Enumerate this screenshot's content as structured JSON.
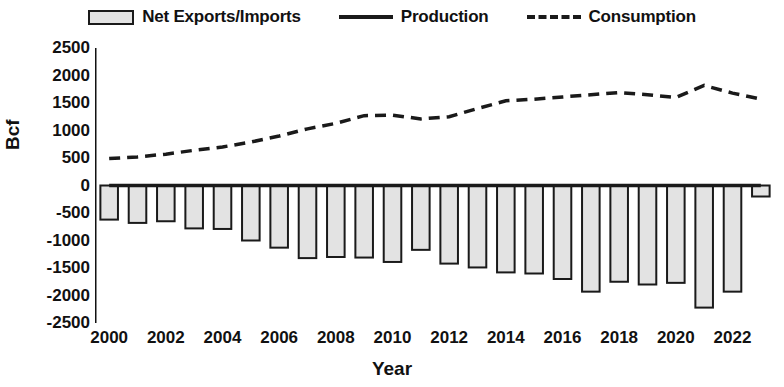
{
  "legend": {
    "items": [
      {
        "label": "Net Exports/Imports",
        "marker": "bar-swatch-icon"
      },
      {
        "label": "Production",
        "marker": "solid-line-icon"
      },
      {
        "label": "Consumption",
        "marker": "dashed-line-icon"
      }
    ]
  },
  "axes": {
    "y_title": "Bcf",
    "x_title": "Year"
  },
  "colors": {
    "bar_fill": "#e3e3e3",
    "bar_stroke": "#1a1a1a",
    "line": "#1a1a1a",
    "text": "#111111",
    "background": "#ffffff"
  },
  "chart_data": {
    "type": "bar",
    "title": "",
    "subtitle": "",
    "xlabel": "Year",
    "ylabel": "Bcf",
    "ylim": [
      -2500,
      2500
    ],
    "ytick_labels": [
      "2500",
      "2000",
      "1500",
      "1000",
      "500",
      "0",
      "-500",
      "-1000",
      "-1500",
      "-2000",
      "-2500"
    ],
    "ytick_values": [
      2500,
      2000,
      1500,
      1000,
      500,
      0,
      -500,
      -1000,
      -1500,
      -2000,
      -2500
    ],
    "xtick_labels": [
      "2000",
      "2002",
      "2004",
      "2006",
      "2008",
      "2010",
      "2012",
      "2014",
      "2016",
      "2018",
      "2020",
      "2022"
    ],
    "xtick_values": [
      2000,
      2002,
      2004,
      2006,
      2008,
      2010,
      2012,
      2014,
      2016,
      2018,
      2020,
      2022
    ],
    "grid": false,
    "legend_position": "top",
    "categories": [
      2000,
      2001,
      2002,
      2003,
      2004,
      2005,
      2006,
      2007,
      2008,
      2009,
      2010,
      2011,
      2012,
      2013,
      2014,
      2015,
      2016,
      2017,
      2018,
      2019,
      2020,
      2021,
      2022,
      2023
    ],
    "series": [
      {
        "name": "Net Exports/Imports",
        "type": "bar",
        "values": [
          -620,
          -680,
          -650,
          -780,
          -790,
          -1000,
          -1130,
          -1320,
          -1300,
          -1310,
          -1390,
          -1170,
          -1420,
          -1490,
          -1580,
          -1600,
          -1700,
          -1930,
          -1750,
          -1800,
          -1770,
          -2220,
          -1930,
          -200
        ]
      },
      {
        "name": "Production",
        "type": "line",
        "style": "solid",
        "values": [
          0,
          0,
          0,
          0,
          0,
          0,
          0,
          0,
          0,
          0,
          0,
          0,
          0,
          0,
          0,
          0,
          0,
          0,
          0,
          0,
          0,
          0,
          0,
          0
        ]
      },
      {
        "name": "Consumption",
        "type": "line",
        "style": "dashed",
        "values": [
          490,
          520,
          570,
          640,
          700,
          790,
          900,
          1030,
          1130,
          1270,
          1280,
          1210,
          1250,
          1400,
          1540,
          1570,
          1610,
          1650,
          1690,
          1650,
          1600,
          1820,
          1680,
          1570
        ]
      }
    ]
  }
}
